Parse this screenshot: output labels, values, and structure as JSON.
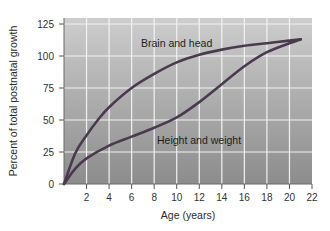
{
  "chart_data": {
    "type": "line",
    "title": "",
    "xlabel": "Age (years)",
    "ylabel": "Percent of total postnatal growth",
    "xlim": [
      0,
      22
    ],
    "ylim": [
      0,
      125
    ],
    "xticks": [
      2,
      4,
      6,
      8,
      10,
      12,
      14,
      16,
      18,
      20,
      22
    ],
    "yticks": [
      0,
      25,
      50,
      75,
      100,
      125
    ],
    "grid": true,
    "legend": "none (direct curve annotations)",
    "series": [
      {
        "name": "Brain and head",
        "x": [
          0,
          1,
          2,
          3,
          4,
          6,
          8,
          10,
          12,
          14,
          16,
          18,
          20,
          21
        ],
        "values": [
          0,
          24,
          38,
          50,
          60,
          75,
          86,
          95,
          101,
          105,
          108,
          110,
          112,
          113
        ]
      },
      {
        "name": "Height and weight",
        "x": [
          0,
          1,
          2,
          4,
          6,
          8,
          10,
          12,
          14,
          16,
          18,
          20,
          21
        ],
        "values": [
          0,
          12,
          20,
          30,
          37,
          44,
          52,
          64,
          78,
          92,
          103,
          110,
          113
        ]
      }
    ],
    "annotations": [
      {
        "text": "Brain and head",
        "x": 6.8,
        "y": 108
      },
      {
        "text": "Height and weight",
        "x": 8.2,
        "y": 33
      }
    ]
  },
  "labels": {
    "xlabel": "Age (years)",
    "ylabel": "Percent of total postnatal growth",
    "brain": "Brain and head",
    "height": "Height and weight"
  },
  "colors": {
    "plot_top": "#c9c9c9",
    "plot_bottom": "#8e8e8e",
    "grid": "#f2f2f2",
    "curve": "#4a3a4e",
    "axis": "#555555"
  }
}
